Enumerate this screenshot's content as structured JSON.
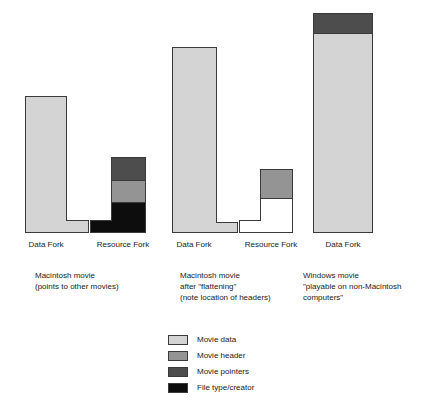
{
  "diagram": {
    "colors": {
      "movie_data": "#d4d4d4",
      "movie_header": "#949494",
      "movie_pointers": "#4d4d4d",
      "file_type_creator": "#0d0d0d",
      "empty": "#ffffff",
      "outline": "#3a3a3a",
      "text": "#1a1a1a",
      "background": "#ffffff"
    },
    "groups": [
      {
        "id": "macintosh-movie",
        "caption": [
          "Macintosh movie",
          "(points to other movies)"
        ],
        "forks": [
          {
            "id": "data-fork-1",
            "label": "Data Fork",
            "segments": [
              {
                "kind": "movie_data",
                "label": "Movie data"
              }
            ]
          },
          {
            "id": "resource-fork-1",
            "label": "Resource Fork",
            "segments": [
              {
                "kind": "movie_pointers",
                "label": "Movie pointers"
              },
              {
                "kind": "movie_header",
                "label": "Movie header"
              },
              {
                "kind": "file_type_creator",
                "label": "File type/creator"
              }
            ]
          }
        ]
      },
      {
        "id": "macintosh-movie-flattened",
        "caption": [
          "Macintosh movie",
          "after \"flattening\"",
          "(note location of headers)"
        ],
        "forks": [
          {
            "id": "data-fork-2",
            "label": "Data Fork",
            "segments": [
              {
                "kind": "movie_data",
                "label": "Movie data"
              }
            ]
          },
          {
            "id": "resource-fork-2",
            "label": "Resource Fork",
            "segments": [
              {
                "kind": "movie_header",
                "label": "Movie header"
              },
              {
                "kind": "empty",
                "label": ""
              }
            ]
          }
        ]
      },
      {
        "id": "windows-movie",
        "caption": [
          "Windows movie",
          "\"playable on non-Macintosh",
          "computers\""
        ],
        "forks": [
          {
            "id": "data-fork-3",
            "label": "Data Fork",
            "segments": [
              {
                "kind": "movie_pointers",
                "label": "Movie pointers"
              },
              {
                "kind": "movie_data",
                "label": "Movie data"
              }
            ]
          }
        ]
      }
    ],
    "legend": [
      {
        "key": "movie_data",
        "label": "Movie data"
      },
      {
        "key": "movie_header",
        "label": "Movie header"
      },
      {
        "key": "movie_pointers",
        "label": "Movie pointers"
      },
      {
        "key": "file_type_creator",
        "label": "File type/creator"
      }
    ]
  }
}
